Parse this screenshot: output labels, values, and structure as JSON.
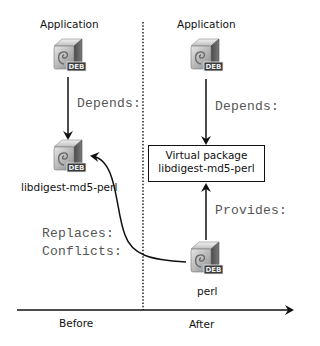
{
  "diagram": {
    "before": {
      "application_label": "Application",
      "depends_label": "Depends:",
      "package_label": "libdigest-md5-perl",
      "replaces_label": "Replaces:",
      "conflicts_label": "Conflicts:"
    },
    "after": {
      "application_label": "Application",
      "depends_label": "Depends:",
      "virtual_package": {
        "line1": "Virtual package",
        "line2": "libdigest-md5-perl"
      },
      "provides_label": "Provides:",
      "package_label": "perl"
    },
    "timeline": {
      "before_label": "Before",
      "after_label": "After"
    },
    "icon": {
      "name": "deb-package-icon",
      "badge_text": "DEB"
    }
  }
}
